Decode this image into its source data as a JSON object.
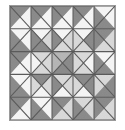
{
  "image": {
    "title": "Quilt block pattern",
    "width": 125,
    "height": 130,
    "background_color": "#ffffff",
    "border_color": "#9a9a9a"
  },
  "palette": {
    "dark": "#8a8a8a",
    "mid": "#b5b5b5",
    "light": "#d8d8d8",
    "white": "#f4f4f4",
    "line": "#5a5a5a"
  },
  "chart_data": {
    "type": "heatmap",
    "xlabel": "",
    "ylabel": "",
    "grid_rows": 5,
    "grid_cols": 5,
    "note": "Each grid cell is split into two or four triangles; value names map to palette shades.",
    "categories": [
      "c1",
      "c2",
      "c3",
      "c4",
      "c5"
    ],
    "cells": [
      [
        {
          "split": "diag-tlbr",
          "a": "dark",
          "b": "white"
        },
        {
          "split": "diag-tlbr",
          "a": "dark",
          "b": "white"
        },
        {
          "split": "diag-tlbr",
          "a": "dark",
          "b": "white"
        },
        {
          "split": "diag-tlbr",
          "a": "dark",
          "b": "white"
        },
        {
          "split": "diag-trbl",
          "a": "white",
          "b": "dark"
        }
      ],
      [
        {
          "split": "diag-trbl",
          "a": "white",
          "b": "dark"
        },
        {
          "split": "quad",
          "top": "white",
          "right": "light",
          "bottom": "dark",
          "left": "dark"
        },
        {
          "split": "quad",
          "top": "white",
          "right": "light",
          "bottom": "light",
          "left": "dark"
        },
        {
          "split": "quad",
          "top": "white",
          "right": "dark",
          "bottom": "light",
          "left": "light"
        },
        {
          "split": "diag-tlbr",
          "a": "dark",
          "b": "light"
        }
      ],
      [
        {
          "split": "diag-tlbr",
          "a": "dark",
          "b": "white"
        },
        {
          "split": "quad",
          "top": "light",
          "right": "light",
          "bottom": "light",
          "left": "white"
        },
        {
          "split": "quad",
          "top": "mid",
          "right": "dark",
          "bottom": "dark",
          "left": "mid"
        },
        {
          "split": "quad",
          "top": "light",
          "right": "white",
          "bottom": "light",
          "left": "light"
        },
        {
          "split": "diag-trbl",
          "a": "white",
          "b": "dark"
        }
      ],
      [
        {
          "split": "diag-trbl",
          "a": "white",
          "b": "dark"
        },
        {
          "split": "quad",
          "top": "dark",
          "right": "light",
          "bottom": "white",
          "left": "light"
        },
        {
          "split": "quad",
          "top": "light",
          "right": "light",
          "bottom": "white",
          "left": "dark"
        },
        {
          "split": "quad",
          "top": "dark",
          "right": "dark",
          "bottom": "white",
          "left": "light"
        },
        {
          "split": "diag-tlbr",
          "a": "light",
          "b": "dark"
        }
      ],
      [
        {
          "split": "diag-tlbr",
          "a": "dark",
          "b": "white"
        },
        {
          "split": "diag-trbl",
          "a": "white",
          "b": "dark"
        },
        {
          "split": "diag-tlbr",
          "a": "dark",
          "b": "light"
        },
        {
          "split": "diag-trbl",
          "a": "light",
          "b": "dark"
        },
        {
          "split": "diag-tlbr",
          "a": "dark",
          "b": "light"
        }
      ]
    ]
  }
}
